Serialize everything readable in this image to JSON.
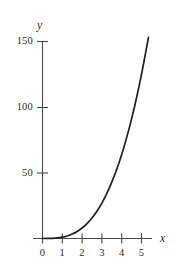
{
  "chart_data": {
    "type": "line",
    "title": "",
    "subtitle": "",
    "xlabel": "x",
    "ylabel": "y",
    "xlim": [
      -0.35,
      5.9
    ],
    "ylim": [
      -6,
      158
    ],
    "grid": false,
    "legend": null,
    "x_ticks": [
      0,
      1,
      2,
      3,
      4,
      5
    ],
    "x_tick_labels": [
      "0",
      "1",
      "2",
      "3",
      "4",
      "5"
    ],
    "y_ticks": [
      50,
      100,
      150
    ],
    "y_tick_labels": [
      "50",
      "100",
      "150"
    ],
    "series": [
      {
        "name": "curve",
        "color": "#1f1f1f",
        "x": [
          0,
          0.25,
          0.5,
          0.75,
          1,
          1.25,
          1.5,
          1.75,
          2,
          2.25,
          2.5,
          2.75,
          3,
          3.25,
          3.5,
          3.75,
          4,
          4.25,
          4.5,
          4.75,
          5,
          5.25,
          5.35
        ],
        "y": [
          0,
          0.02,
          0.13,
          0.42,
          1,
          1.95,
          3.4,
          5.4,
          8,
          11.4,
          15.6,
          20.8,
          27,
          34.3,
          42.9,
          52.7,
          64,
          76.8,
          91.1,
          107.2,
          125,
          144.7,
          153.1
        ]
      }
    ],
    "annotations": []
  },
  "axis_labels": {
    "x": "x",
    "y": "y"
  },
  "colors": {
    "curve": "#1f1f1f",
    "axis": "#4a4a4a",
    "text": "#2b2b2b",
    "background": "#ffffff"
  }
}
